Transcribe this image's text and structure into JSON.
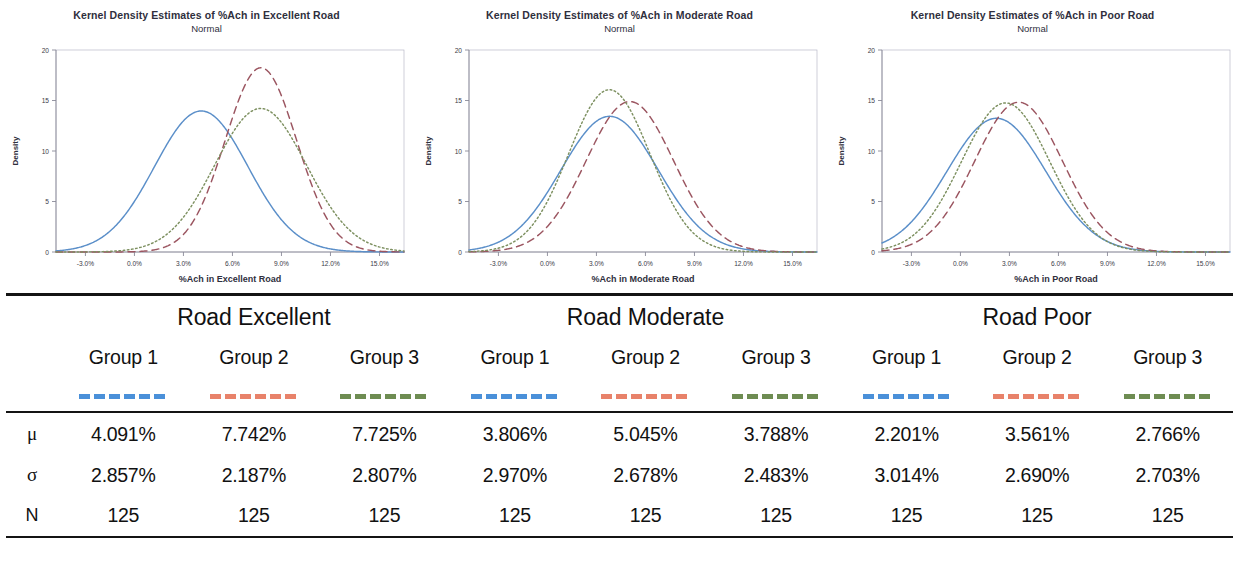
{
  "colors": {
    "group1_line": "#5b8fc9",
    "group2_line": "#9b5560",
    "group3_line": "#7d9060",
    "group1_swatch": "#4a90d9",
    "group2_swatch": "#e8826a",
    "group3_swatch": "#6e8c52",
    "axis": "#b9b9c8",
    "rule": "#141414",
    "text": "#2f2f3d"
  },
  "charts": [
    {
      "title": "Kernel Density Estimates of %Ach in Excellent Road",
      "subtitle": "Normal",
      "xlabel": "%Ach in Excellent Road",
      "ylabel": "Density"
    },
    {
      "title": "Kernel Density Estimates of %Ach in Moderate Road",
      "subtitle": "Normal",
      "xlabel": "%Ach in Moderate Road",
      "ylabel": "Density"
    },
    {
      "title": "Kernel Density Estimates of %Ach in Poor Road",
      "subtitle": "Normal",
      "xlabel": "%Ach in Poor Road",
      "ylabel": "Density"
    }
  ],
  "chart_data": [
    {
      "type": "line",
      "title": "Kernel Density Estimates of %Ach in Excellent Road",
      "subtitle": "Normal",
      "xlabel": "%Ach in Excellent Road",
      "ylabel": "Density",
      "xlim": [
        -4.8,
        16.5
      ],
      "ylim": [
        0,
        20
      ],
      "xticks": [
        "-3.0%",
        "0.0%",
        "3.0%",
        "6.0%",
        "9.0%",
        "12.0%",
        "15.0%"
      ],
      "xtick_values": [
        -3,
        0,
        3,
        6,
        9,
        12,
        15
      ],
      "yticks": [
        "0",
        "5",
        "10",
        "15",
        "20"
      ],
      "ytick_values": [
        0,
        5,
        10,
        15,
        20
      ],
      "grid": false,
      "legend_position": "table-below",
      "series": [
        {
          "name": "Group 1",
          "style": "solid",
          "color": "#5b8fc9",
          "mean": 4.091,
          "sd": 2.857,
          "n": 125,
          "peak_density": 13.96,
          "peak_x": 4.091
        },
        {
          "name": "Group 2",
          "style": "dashed",
          "color": "#9b5560",
          "mean": 7.742,
          "sd": 2.187,
          "n": 125,
          "peak_density": 18.24,
          "peak_x": 7.742
        },
        {
          "name": "Group 3",
          "style": "dotted",
          "color": "#7d9060",
          "mean": 7.725,
          "sd": 2.807,
          "n": 125,
          "peak_density": 14.21,
          "peak_x": 7.725
        }
      ]
    },
    {
      "type": "line",
      "title": "Kernel Density Estimates of %Ach in Moderate Road",
      "subtitle": "Normal",
      "xlabel": "%Ach in Moderate Road",
      "ylabel": "Density",
      "xlim": [
        -4.8,
        16.5
      ],
      "ylim": [
        0,
        20
      ],
      "xticks": [
        "-3.0%",
        "0.0%",
        "3.0%",
        "6.0%",
        "9.0%",
        "12.0%",
        "15.0%"
      ],
      "xtick_values": [
        -3,
        0,
        3,
        6,
        9,
        12,
        15
      ],
      "yticks": [
        "0",
        "5",
        "10",
        "15",
        "20"
      ],
      "ytick_values": [
        0,
        5,
        10,
        15,
        20
      ],
      "grid": false,
      "legend_position": "table-below",
      "series": [
        {
          "name": "Group 1",
          "style": "solid",
          "color": "#5b8fc9",
          "mean": 3.806,
          "sd": 2.97,
          "n": 125,
          "peak_density": 13.43,
          "peak_x": 3.806
        },
        {
          "name": "Group 2",
          "style": "dashed",
          "color": "#9b5560",
          "mean": 5.045,
          "sd": 2.678,
          "n": 125,
          "peak_density": 14.89,
          "peak_x": 5.045
        },
        {
          "name": "Group 3",
          "style": "dotted",
          "color": "#7d9060",
          "mean": 3.788,
          "sd": 2.483,
          "n": 125,
          "peak_density": 16.06,
          "peak_x": 3.788
        }
      ]
    },
    {
      "type": "line",
      "title": "Kernel Density Estimates of %Ach in Poor Road",
      "subtitle": "Normal",
      "xlabel": "%Ach in Poor Road",
      "ylabel": "Density",
      "xlim": [
        -4.8,
        16.5
      ],
      "ylim": [
        0,
        20
      ],
      "xticks": [
        "-3.0%",
        "0.0%",
        "3.0%",
        "6.0%",
        "9.0%",
        "12.0%",
        "15.0%"
      ],
      "xtick_values": [
        -3,
        0,
        3,
        6,
        9,
        12,
        15
      ],
      "yticks": [
        "0",
        "5",
        "10",
        "15",
        "20"
      ],
      "ytick_values": [
        0,
        5,
        10,
        15,
        20
      ],
      "grid": false,
      "legend_position": "table-below",
      "series": [
        {
          "name": "Group 1",
          "style": "solid",
          "color": "#5b8fc9",
          "mean": 2.201,
          "sd": 3.014,
          "n": 125,
          "peak_density": 13.24,
          "peak_x": 2.201
        },
        {
          "name": "Group 2",
          "style": "dashed",
          "color": "#9b5560",
          "mean": 3.561,
          "sd": 2.69,
          "n": 125,
          "peak_density": 14.83,
          "peak_x": 3.561
        },
        {
          "name": "Group 3",
          "style": "dotted",
          "color": "#7d9060",
          "mean": 2.766,
          "sd": 2.703,
          "n": 125,
          "peak_density": 14.76,
          "peak_x": 2.766
        }
      ]
    }
  ],
  "table": {
    "road_headers": [
      "Road Excellent",
      "Road Moderate",
      "Road Poor"
    ],
    "group_headers": [
      "Group 1",
      "Group 2",
      "Group 3",
      "Group 1",
      "Group 2",
      "Group 3",
      "Group 1",
      "Group 2",
      "Group 3"
    ],
    "swatch_colors": [
      "#4a90d9",
      "#e8826a",
      "#6e8c52",
      "#4a90d9",
      "#e8826a",
      "#6e8c52",
      "#4a90d9",
      "#e8826a",
      "#6e8c52"
    ],
    "rows": [
      {
        "label": "μ",
        "values": [
          "4.091%",
          "7.742%",
          "7.725%",
          "3.806%",
          "5.045%",
          "3.788%",
          "2.201%",
          "3.561%",
          "2.766%"
        ]
      },
      {
        "label": "σ",
        "values": [
          "2.857%",
          "2.187%",
          "2.807%",
          "2.970%",
          "2.678%",
          "2.483%",
          "3.014%",
          "2.690%",
          "2.703%"
        ]
      },
      {
        "label": "N",
        "values": [
          "125",
          "125",
          "125",
          "125",
          "125",
          "125",
          "125",
          "125",
          "125"
        ]
      }
    ]
  }
}
